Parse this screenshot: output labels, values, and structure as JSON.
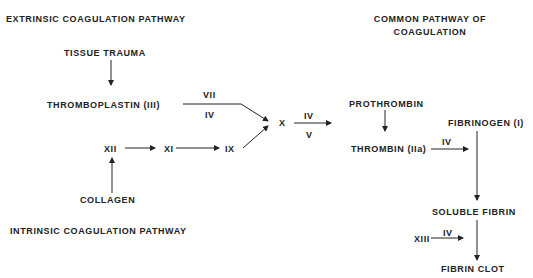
{
  "headings": {
    "extrinsic": "EXTRINSIC COAGULATION PATHWAY",
    "intrinsic": "INTRINSIC COAGULATION PATHWAY",
    "common_line1": "COMMON PATHWAY OF",
    "common_line2": "COAGULATION"
  },
  "nodes": {
    "tissue_trauma": "TISSUE TRAUMA",
    "thromboplastin": "THROMBOPLASTIN (III)",
    "xii": "XII",
    "xi": "XI",
    "ix": "IX",
    "collagen": "COLLAGEN",
    "x": "X",
    "prothrombin": "PROTHROMBIN",
    "thrombin": "THROMBIN (IIa)",
    "fibrinogen": "FIBRINOGEN (I)",
    "soluble_fibrin": "SOLUBLE FIBRIN",
    "xiii": "XIII",
    "fibrin_clot": "FIBRIN CLOT"
  },
  "cofactors": {
    "thromboplastin_above": "VII",
    "thromboplastin_below": "IV",
    "x_above": "IV",
    "x_below": "V",
    "thrombin_above": "IV",
    "xiii_above": "IV"
  },
  "colors": {
    "ink": "#222222",
    "background": "#ffffff"
  }
}
